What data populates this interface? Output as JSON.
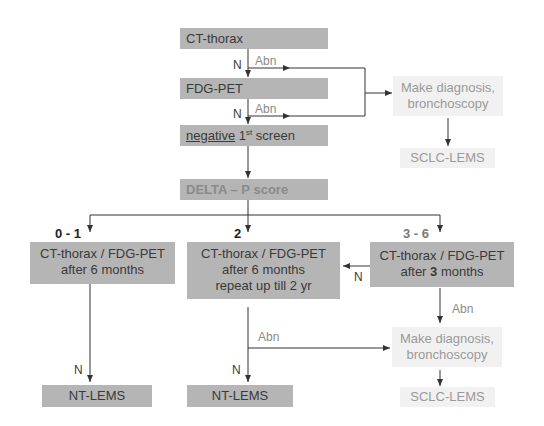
{
  "nodes": {
    "ct_thorax": "CT-thorax",
    "fdg_pet": "FDG-PET",
    "negative_screen": {
      "underlined": "negative",
      "num": "1",
      "sup": "st",
      "rest": " screen"
    },
    "delta_p": "DELTA – P score",
    "diag_top": {
      "line1": "Make diagnosis,",
      "line2": "bronchoscopy"
    },
    "sclc_top": "SCLC-LEMS",
    "branch_01": {
      "line1": "CT-thorax / FDG-PET",
      "line2": "after 6 months"
    },
    "branch_2": {
      "line1": "CT-thorax / FDG-PET",
      "line2": "after 6 months",
      "line3": "repeat up till 2 yr"
    },
    "branch_36": {
      "line1": "CT-thorax / FDG-PET",
      "line2_pre": "after ",
      "line2_bold": "3",
      "line2_post": " months"
    },
    "nt_lems_left": "NT-LEMS",
    "nt_lems_mid": "NT-LEMS",
    "diag_bottom": {
      "line1": "Make diagnosis,",
      "line2": "bronchoscopy"
    },
    "sclc_bottom": "SCLC-LEMS"
  },
  "labels": {
    "n1": "N",
    "abn1": "Abn",
    "n2": "N",
    "abn2": "Abn",
    "score_01": "0 - 1",
    "score_2": "2",
    "score_36": "3 - 6",
    "n_36": "N",
    "abn_36": "Abn",
    "abn_mid": "Abn",
    "n_mid": "N",
    "n_left": "N"
  },
  "colors": {
    "box_dark": "#b5b5b5",
    "box_light": "#f1f1f1",
    "line": "#333333"
  }
}
